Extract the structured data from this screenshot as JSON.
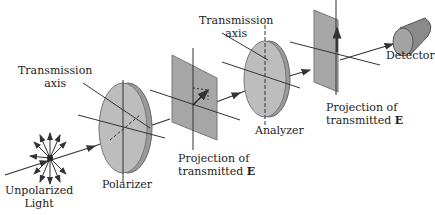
{
  "labels": {
    "transmission_axis_1": [
      "Transmission",
      "axis"
    ],
    "transmission_axis_2": [
      "Transmission",
      "axis"
    ],
    "unpolarized_light": [
      "Unpolarized",
      "Light"
    ],
    "polarizer": "Polarizer",
    "analyzer": "Analyzer",
    "detector": "Detector",
    "projection_1": [
      "Projection of",
      "transmitted",
      "E"
    ],
    "projection_2": [
      "Projection of",
      "transmitted",
      "E"
    ]
  },
  "colors": {
    "component_fill": "#b8b8b8",
    "component_edge": "#8a8a8a",
    "line": "#333333"
  }
}
